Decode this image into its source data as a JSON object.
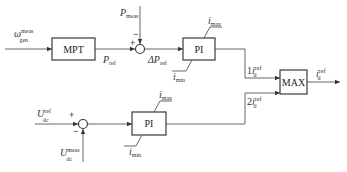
{
  "blocks": {
    "mpt": "MPT",
    "pi_power": "PI",
    "pi_voltage": "PI",
    "max": "MAX"
  },
  "signals": {
    "omega_in": {
      "main": "ω",
      "sup": "meas",
      "sub": "gen"
    },
    "p_meas": {
      "main": "P",
      "sub": "meas"
    },
    "p_ref": {
      "main": "P",
      "sub": "ref"
    },
    "delta_p_ref": {
      "main": "ΔP",
      "sub": "ref"
    },
    "i_max_top": {
      "main": "i",
      "sub": "max"
    },
    "i_min_top": {
      "main": "i",
      "sub": "min"
    },
    "id1_ref": {
      "prefix": "1",
      "main": "i",
      "sup": "ref",
      "sub": "d"
    },
    "id2_ref": {
      "prefix": "2",
      "main": "i",
      "sup": "ref",
      "sub": "d"
    },
    "id_ref_out": {
      "main": "i",
      "sup": "ref",
      "sub": "d"
    },
    "udc_ref": {
      "main": "U",
      "sup": "ref",
      "sub": "dc"
    },
    "udc_meas": {
      "main": "U",
      "sup": "meas",
      "sub": "dc"
    },
    "i_max_bottom": {
      "main": "i",
      "sub": "max"
    },
    "i_min_bottom": {
      "main": "i",
      "sub": "min"
    }
  },
  "signs": {
    "sum1_plus": "+",
    "sum1_minus": "−",
    "sum2_plus": "+",
    "sum2_minus": "−"
  },
  "colors": {
    "line": "#555555",
    "block_border": "#3a3a3a",
    "text": "#333333"
  }
}
